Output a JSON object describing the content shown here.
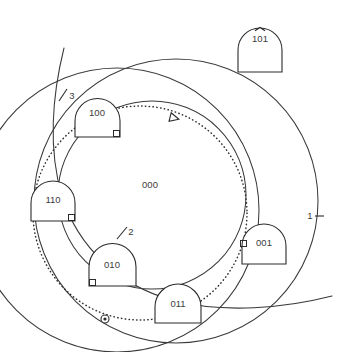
{
  "figure": {
    "background_color": "#ffffff",
    "stroke_color": "#2b2b2b",
    "width": 337,
    "height": 352
  },
  "nodes": [
    {
      "id": "node-101",
      "label": "101",
      "x": 238,
      "y": 36,
      "w": 44,
      "h": 36,
      "shape": "dome",
      "has_top_notch": true,
      "has_corner_square": false,
      "corner": ""
    },
    {
      "id": "node-100",
      "label": "100",
      "x": 75,
      "y": 104,
      "w": 45,
      "h": 33,
      "shape": "dome",
      "has_top_notch": false,
      "has_corner_square": true,
      "corner": "bottom-right"
    },
    {
      "id": "node-110",
      "label": "110",
      "x": 31,
      "y": 185,
      "w": 44,
      "h": 36,
      "shape": "dome",
      "has_top_notch": false,
      "has_corner_square": true,
      "corner": "bottom-right"
    },
    {
      "id": "node-010",
      "label": "010",
      "x": 89,
      "y": 250,
      "w": 47,
      "h": 36,
      "shape": "dome",
      "has_top_notch": false,
      "has_corner_square": true,
      "corner": "bottom-left"
    },
    {
      "id": "node-011",
      "label": "011",
      "x": 155,
      "y": 290,
      "w": 46,
      "h": 33,
      "shape": "dome",
      "has_top_notch": false,
      "has_corner_square": false,
      "corner": ""
    },
    {
      "id": "node-001",
      "label": "001",
      "x": 242,
      "y": 228,
      "w": 44,
      "h": 36,
      "shape": "dome",
      "has_top_notch": false,
      "has_corner_square": true,
      "corner": "top-left"
    }
  ],
  "region_labels": [
    {
      "id": "region-000",
      "label": "000",
      "x": 150,
      "y": 185
    }
  ],
  "circle_labels": [
    {
      "id": "circle-label-1",
      "label": "1",
      "x": 310,
      "y": 216,
      "tick_x1": 315,
      "tick_y1": 216,
      "tick_x2": 324,
      "tick_y2": 216
    },
    {
      "id": "circle-label-2",
      "label": "2",
      "x": 130,
      "y": 232,
      "tick_x1": 118,
      "tick_y1": 238,
      "tick_x2": 127,
      "tick_y2": 228
    },
    {
      "id": "circle-label-3",
      "label": "3",
      "x": 72,
      "y": 96,
      "tick_x1": 60,
      "tick_y1": 100,
      "tick_x2": 66,
      "tick_y2": 90
    }
  ],
  "circles": [
    {
      "id": "circle-big-left",
      "cx": 117,
      "cy": 210,
      "r": 142,
      "kind": "solid"
    },
    {
      "id": "circle-big-right",
      "cx": 176,
      "cy": 201,
      "r": 142,
      "kind": "solid"
    },
    {
      "id": "circle-inner",
      "cx": 152,
      "cy": 195,
      "r": 94,
      "kind": "solid"
    },
    {
      "id": "circle-dotted-path",
      "cx": 140,
      "cy": 213,
      "r": 107,
      "kind": "dotted"
    }
  ],
  "arcs": [
    {
      "id": "arc-sweep-left-bottom",
      "description": "long open curve entering top-left and exiting bottom-right"
    }
  ],
  "markers": [
    {
      "id": "arrow-marker",
      "type": "triangle-arrowhead",
      "x": 174,
      "y": 118,
      "rotation": 12
    },
    {
      "id": "origin-marker",
      "type": "circle-with-dot",
      "x": 105,
      "y": 319,
      "r": 4
    }
  ]
}
